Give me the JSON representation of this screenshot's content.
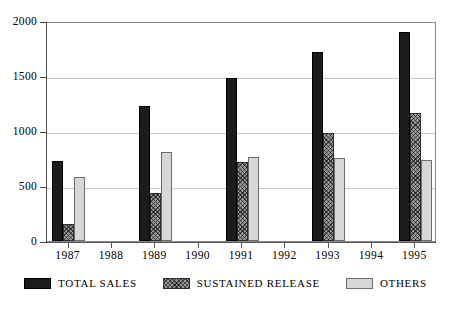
{
  "chart_data": {
    "type": "bar",
    "title": "",
    "subtitle": "",
    "xlabel": "",
    "ylabel": "",
    "ylim": [
      0,
      2000
    ],
    "yticks": [
      0,
      500,
      1000,
      1500,
      2000
    ],
    "ytick_labels": [
      "0",
      "500",
      "1000",
      "1500",
      "2000"
    ],
    "grid": true,
    "grid_axis": "y",
    "legend_position": "bottom",
    "categories": [
      "1987",
      "1988",
      "1989",
      "1990",
      "1991",
      "1992",
      "1993",
      "1994",
      "1995"
    ],
    "series": [
      {
        "name": "TOTAL SALES",
        "color": "#1c1c1c",
        "pattern": "solid-black",
        "values": [
          730,
          null,
          1230,
          null,
          1480,
          null,
          1720,
          null,
          1900
        ]
      },
      {
        "name": "SUSTAINED RELEASE",
        "color": "#9a9a9a",
        "pattern": "crosshatch-gray",
        "values": [
          150,
          null,
          440,
          null,
          715,
          null,
          985,
          null,
          1160
        ]
      },
      {
        "name": "OTHERS",
        "color": "#d7d7d7",
        "pattern": "solid-light-gray",
        "values": [
          580,
          null,
          805,
          null,
          765,
          null,
          750,
          null,
          735
        ]
      }
    ]
  },
  "axes": {
    "y_labels": [
      "2000",
      "1500",
      "1000",
      "500",
      "0"
    ],
    "x_labels": [
      "1987",
      "1988",
      "1989",
      "1990",
      "1991",
      "1992",
      "1993",
      "1994",
      "1995"
    ]
  },
  "legend": {
    "items": [
      {
        "label": "TOTAL SALES",
        "swatch": "solid-black"
      },
      {
        "label": "SUSTAINED RELEASE",
        "swatch": "crosshatch-gray"
      },
      {
        "label": "OTHERS",
        "swatch": "solid-light-gray"
      }
    ]
  },
  "colors": {
    "total_sales": "#1c1c1c",
    "sustained_release": "#9a9a9a",
    "others": "#d7d7d7",
    "gridline": "#c9c9c9",
    "frame": "#8a8a8a"
  }
}
